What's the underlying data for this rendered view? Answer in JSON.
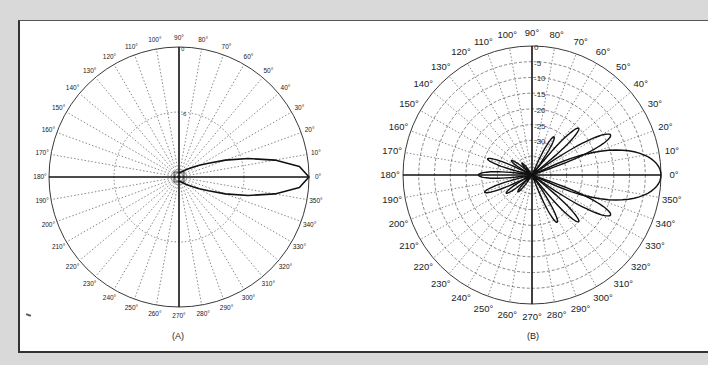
{
  "figure": {
    "captions": [
      "(A)",
      "(B)"
    ],
    "background_color": "#d9d9d9",
    "panel_color": "#ffffff",
    "line_color": "#111111",
    "grid_color": "#555555"
  },
  "chart_data": [
    {
      "type": "polar",
      "id": "A",
      "title": "(A)",
      "center": [
        179,
        177
      ],
      "radius_px": 130,
      "angle_tick_step_deg": 10,
      "angle_labels": [
        "0°",
        "10°",
        "20°",
        "30°",
        "40°",
        "50°",
        "60°",
        "70°",
        "80°",
        "90°",
        "100°",
        "110°",
        "120°",
        "130°",
        "140°",
        "150°",
        "160°",
        "170°",
        "180°",
        "190°",
        "200°",
        "210°",
        "220°",
        "230°",
        "240°",
        "250°",
        "260°",
        "270°",
        "280°",
        "290°",
        "300°",
        "310°",
        "320°",
        "330°",
        "340°",
        "350°"
      ],
      "radial_unit": "dB",
      "radial_range": [
        -12,
        0
      ],
      "radial_ticks": [
        0,
        -6
      ],
      "radial_tick_labels": [
        "0",
        "-6"
      ],
      "grid": true,
      "series": [
        {
          "name": "main beam",
          "theta_deg": [
            -90,
            -60,
            -45,
            -35,
            -30,
            -25,
            -20,
            -15,
            -10,
            -5,
            0,
            5,
            10,
            15,
            20,
            25,
            30,
            35,
            45,
            60,
            90
          ],
          "r_norm": [
            0.03,
            0.05,
            0.08,
            0.13,
            0.18,
            0.25,
            0.38,
            0.55,
            0.75,
            0.93,
            1.0,
            0.93,
            0.75,
            0.55,
            0.38,
            0.25,
            0.18,
            0.13,
            0.08,
            0.05,
            0.03
          ]
        }
      ]
    },
    {
      "type": "polar",
      "id": "B",
      "title": "(B)",
      "center": [
        532,
        175
      ],
      "radius_px": 129,
      "angle_tick_step_deg": 10,
      "angle_labels": [
        "0°",
        "10°",
        "20°",
        "30°",
        "40°",
        "50°",
        "60°",
        "70°",
        "80°",
        "90°",
        "100°",
        "110°",
        "120°",
        "130°",
        "140°",
        "150°",
        "160°",
        "170°",
        "180°",
        "190°",
        "200°",
        "210°",
        "220°",
        "230°",
        "240°",
        "250°",
        "260°",
        "270°",
        "280°",
        "290°",
        "300°",
        "310°",
        "320°",
        "330°",
        "340°",
        "350°"
      ],
      "radial_unit": "dB",
      "radial_range": [
        -41,
        0
      ],
      "radial_ticks": [
        0,
        -5,
        -10,
        -15,
        -20,
        -25,
        -30,
        -35,
        -40
      ],
      "radial_tick_labels": [
        "0",
        "-5",
        "-10",
        "-15",
        "-20",
        "-25",
        "-30",
        "-35",
        "-40"
      ],
      "grid": true,
      "series": [
        {
          "name": "main lobe (dB)",
          "lobes": [
            {
              "center_deg": 0,
              "peak_db": 0,
              "half_width_deg": 16
            },
            {
              "center_deg": 27,
              "peak_db": -13,
              "half_width_deg": 5
            },
            {
              "center_deg": -27,
              "peak_db": -13,
              "half_width_deg": 5
            },
            {
              "center_deg": 45,
              "peak_db": -20,
              "half_width_deg": 4
            },
            {
              "center_deg": -45,
              "peak_db": -20,
              "half_width_deg": 4
            },
            {
              "center_deg": 60,
              "peak_db": -27,
              "half_width_deg": 4
            },
            {
              "center_deg": -62,
              "peak_db": -24,
              "half_width_deg": 4
            },
            {
              "center_deg": 180,
              "peak_db": -24,
              "half_width_deg": 5
            },
            {
              "center_deg": 160,
              "peak_db": -26,
              "half_width_deg": 4
            },
            {
              "center_deg": 200,
              "peak_db": -25,
              "half_width_deg": 4
            },
            {
              "center_deg": 145,
              "peak_db": -33,
              "half_width_deg": 4
            },
            {
              "center_deg": 215,
              "peak_db": -31,
              "half_width_deg": 4
            },
            {
              "center_deg": 230,
              "peak_db": -34,
              "half_width_deg": 4
            },
            {
              "center_deg": 130,
              "peak_db": -36,
              "half_width_deg": 4
            }
          ]
        }
      ]
    }
  ]
}
